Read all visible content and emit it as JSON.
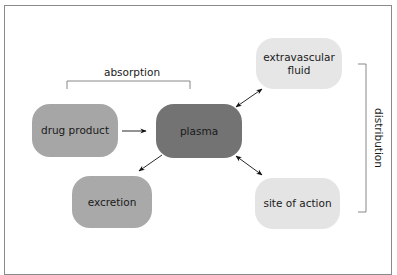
{
  "diagram": {
    "colors": {
      "frame": "#8a8a8a",
      "drug_product": "#a6a6a6",
      "plasma": "#737373",
      "excretion": "#a9a9a9",
      "extravascular_fluid": "#e6e6e6",
      "site_of_action": "#e4e4e4",
      "text": "#1a1a1a",
      "bracket": "#6b6b6b"
    },
    "nodes": {
      "drug_product": "drug product",
      "plasma": "plasma",
      "extravascular_fluid_line1": "extravascular",
      "extravascular_fluid_line2": "fluid",
      "excretion": "excretion",
      "site_of_action": "site of action"
    },
    "brackets": {
      "absorption": "absorption",
      "distribution": "distribution"
    },
    "edges": [
      {
        "from": "drug product",
        "to": "plasma",
        "type": "one-way"
      },
      {
        "from": "plasma",
        "to": "excretion",
        "type": "one-way"
      },
      {
        "from": "plasma",
        "to": "extravascular fluid",
        "type": "two-way"
      },
      {
        "from": "plasma",
        "to": "site of action",
        "type": "two-way"
      }
    ]
  }
}
